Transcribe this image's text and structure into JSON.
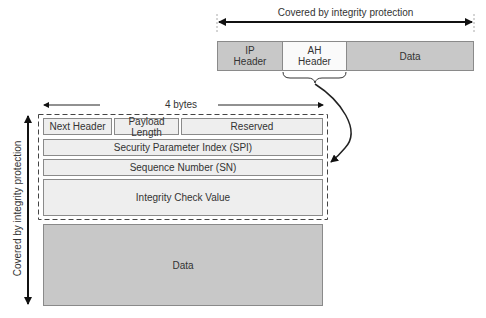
{
  "top_packet": {
    "coverage_label": "Covered by integrity protection",
    "segments": [
      {
        "label": "IP\nHeader",
        "line1": "IP",
        "line2": "Header"
      },
      {
        "label": "AH\nHeader",
        "line1": "AH",
        "line2": "Header"
      },
      {
        "label": "Data"
      }
    ]
  },
  "ah_format": {
    "width_label": "4 bytes",
    "vertical_coverage_label": "Covered by integrity protection",
    "fields": {
      "next_header": "Next Header",
      "payload_length": "Payload Length",
      "reserved": "Reserved",
      "spi": "Security Parameter Index (SPI)",
      "sn": "Sequence Number (SN)",
      "icv": "Integrity Check Value"
    },
    "data_label": "Data"
  },
  "colors": {
    "dark_fill": "#c8c8c8",
    "light_fill": "#eeeeee",
    "ah_fill": "#fafafa",
    "stroke": "#8a8a8a",
    "arrow": "#111111"
  }
}
